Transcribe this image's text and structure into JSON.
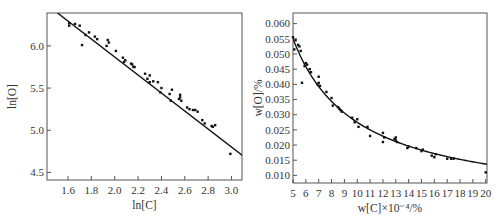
{
  "chart_data": [
    {
      "type": "scatter",
      "title": "",
      "xlabel": "ln[C]",
      "ylabel": "ln[O]",
      "xlim": [
        1.42,
        3.09
      ],
      "ylim": [
        4.41,
        6.39
      ],
      "xticks": [
        1.6,
        1.8,
        2.0,
        2.2,
        2.4,
        2.6,
        2.8,
        3.0
      ],
      "xtick_labels": [
        "1.6",
        "1.8",
        "2.0",
        "2.2",
        "2.4",
        "2.6",
        "2.8",
        "3.0"
      ],
      "yticks": [
        4.5,
        5.0,
        5.5,
        6.0
      ],
      "ytick_labels": [
        "4.5",
        "5.0",
        "5.5",
        "6.0"
      ],
      "grid": false,
      "legend": null,
      "fit_line": {
        "type": "linear",
        "points": [
          [
            1.51,
            6.39
          ],
          [
            3.095,
            4.7
          ]
        ]
      },
      "series": [
        {
          "name": "data",
          "points": [
            [
              1.61,
              6.27
            ],
            [
              1.61,
              6.24
            ],
            [
              1.66,
              6.26
            ],
            [
              1.7,
              6.24
            ],
            [
              1.72,
              6.01
            ],
            [
              1.75,
              6.13
            ],
            [
              1.78,
              6.16
            ],
            [
              1.83,
              6.11
            ],
            [
              1.85,
              6.08
            ],
            [
              1.93,
              6.0
            ],
            [
              1.94,
              6.07
            ],
            [
              1.95,
              6.04
            ],
            [
              2.01,
              5.94
            ],
            [
              2.07,
              5.86
            ],
            [
              2.08,
              5.81
            ],
            [
              2.09,
              5.83
            ],
            [
              2.14,
              5.79
            ],
            [
              2.15,
              5.78
            ],
            [
              2.16,
              5.75
            ],
            [
              2.17,
              5.75
            ],
            [
              2.26,
              5.67
            ],
            [
              2.28,
              5.61
            ],
            [
              2.3,
              5.65
            ],
            [
              2.3,
              5.57
            ],
            [
              2.33,
              5.58
            ],
            [
              2.37,
              5.57
            ],
            [
              2.39,
              5.45
            ],
            [
              2.4,
              5.5
            ],
            [
              2.47,
              5.43
            ],
            [
              2.48,
              5.35
            ],
            [
              2.49,
              5.48
            ],
            [
              2.55,
              5.37
            ],
            [
              2.56,
              5.42
            ],
            [
              2.56,
              5.39
            ],
            [
              2.57,
              5.35
            ],
            [
              2.62,
              5.27
            ],
            [
              2.64,
              5.25
            ],
            [
              2.67,
              5.24
            ],
            [
              2.69,
              5.24
            ],
            [
              2.71,
              5.22
            ],
            [
              2.75,
              5.12
            ],
            [
              2.77,
              5.08
            ],
            [
              2.83,
              5.05
            ],
            [
              2.84,
              5.04
            ],
            [
              2.86,
              5.06
            ],
            [
              2.99,
              4.72
            ]
          ]
        }
      ]
    },
    {
      "type": "scatter",
      "title": "",
      "xlabel": "w[C]×10⁻⁴/%",
      "ylabel": "w[O]/%",
      "xlim": [
        5,
        20.1
      ],
      "ylim": [
        0.0075,
        0.0635
      ],
      "xticks": [
        5,
        6,
        7,
        8,
        9,
        10,
        11,
        12,
        13,
        14,
        15,
        16,
        17,
        18,
        19,
        20
      ],
      "xtick_labels": [
        "5",
        "6",
        "7",
        "8",
        "9",
        "10",
        "11",
        "12",
        "13",
        "14",
        "15",
        "16",
        "17",
        "18",
        "19",
        "20"
      ],
      "yticks": [
        0.01,
        0.015,
        0.02,
        0.025,
        0.03,
        0.035,
        0.04,
        0.045,
        0.05,
        0.055,
        0.06
      ],
      "ytick_labels": [
        "0.010",
        "0.015",
        "0.020",
        "0.025",
        "0.030",
        "0.035",
        "0.040",
        "0.045",
        "0.050",
        "0.055",
        "0.060"
      ],
      "grid": false,
      "legend": null,
      "fit_line": {
        "type": "hyperbolic",
        "formula": "w[O] = 0.275 / w[C]"
      },
      "series": [
        {
          "name": "data",
          "points": [
            [
              5.0,
              0.0555
            ],
            [
              5.1,
              0.0515
            ],
            [
              5.2,
              0.0545
            ],
            [
              5.4,
              0.053
            ],
            [
              5.5,
              0.0525
            ],
            [
              5.6,
              0.051
            ],
            [
              5.7,
              0.0405
            ],
            [
              5.9,
              0.046
            ],
            [
              6.0,
              0.047
            ],
            [
              6.1,
              0.0465
            ],
            [
              6.3,
              0.045
            ],
            [
              6.4,
              0.044
            ],
            [
              6.9,
              0.04
            ],
            [
              7.0,
              0.0425
            ],
            [
              7.0,
              0.0405
            ],
            [
              7.1,
              0.0395
            ],
            [
              7.6,
              0.0375
            ],
            [
              8.0,
              0.0355
            ],
            [
              8.1,
              0.033
            ],
            [
              8.5,
              0.0325
            ],
            [
              8.6,
              0.032
            ],
            [
              8.7,
              0.0315
            ],
            [
              8.8,
              0.031
            ],
            [
              9.6,
              0.029
            ],
            [
              9.8,
              0.0275
            ],
            [
              10.0,
              0.0285
            ],
            [
              10.1,
              0.026
            ],
            [
              10.8,
              0.026
            ],
            [
              11.0,
              0.023
            ],
            [
              12.0,
              0.024
            ],
            [
              12.0,
              0.021
            ],
            [
              12.1,
              0.0225
            ],
            [
              12.9,
              0.022
            ],
            [
              13.0,
              0.0215
            ],
            [
              13.0,
              0.0225
            ],
            [
              13.1,
              0.021
            ],
            [
              13.9,
              0.019
            ],
            [
              14.0,
              0.0195
            ],
            [
              14.6,
              0.019
            ],
            [
              15.0,
              0.018
            ],
            [
              15.1,
              0.0185
            ],
            [
              15.8,
              0.0165
            ],
            [
              16.0,
              0.016
            ],
            [
              16.1,
              0.017
            ],
            [
              17.0,
              0.0155
            ],
            [
              17.3,
              0.0155
            ],
            [
              17.5,
              0.0155
            ],
            [
              20.0,
              0.011
            ]
          ]
        }
      ]
    }
  ]
}
